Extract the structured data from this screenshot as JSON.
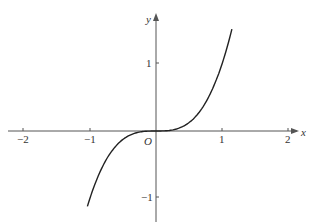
{
  "chart_data": {
    "type": "line",
    "title": "",
    "function": "y = x^3",
    "xlabel": "x",
    "ylabel": "y",
    "origin_label": "O",
    "xlim": [
      -2.1,
      2.15
    ],
    "ylim": [
      -1.15,
      1.75
    ],
    "x_ticks": [
      "-2",
      "-1",
      "1",
      "2"
    ],
    "y_ticks": [
      "1",
      "-1"
    ],
    "grid": false,
    "series": [
      {
        "name": "curve",
        "x_range": [
          -1.04,
          1.15
        ]
      }
    ]
  },
  "labels": {
    "x": "x",
    "y": "y",
    "o": "O",
    "xm2": "−2",
    "xm1": "−1",
    "x1": "1",
    "x2": "2",
    "y1": "1",
    "ym1": "−1"
  }
}
